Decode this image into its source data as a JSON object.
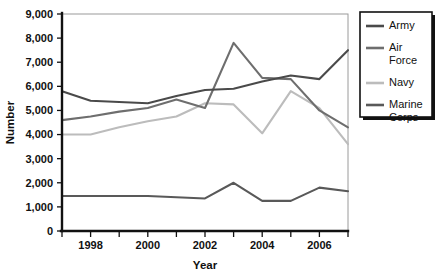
{
  "chart_data": {
    "type": "line",
    "title": "",
    "xlabel": "Year",
    "ylabel": "Number",
    "x": [
      1997,
      1998,
      1999,
      2000,
      2001,
      2002,
      2003,
      2004,
      2005,
      2006,
      2007
    ],
    "xtick_labels": [
      "1998",
      "2000",
      "2002",
      "2004",
      "2006"
    ],
    "xticks": [
      1998,
      2000,
      2002,
      2004,
      2006
    ],
    "xlim": [
      1997,
      2007
    ],
    "ylim": [
      0,
      9000
    ],
    "yticks": [
      0,
      1000,
      2000,
      3000,
      4000,
      5000,
      6000,
      7000,
      8000,
      9000
    ],
    "ytick_labels": [
      "0",
      "1,000",
      "2,000",
      "3,000",
      "4,000",
      "5,000",
      "6,000",
      "7,000",
      "8,000",
      "9,000"
    ],
    "grid": false,
    "legend_position": "right",
    "series": [
      {
        "name": "Army",
        "color": "#4a4a4a",
        "values": [
          5800,
          5400,
          5350,
          5300,
          5600,
          5850,
          5900,
          6200,
          6450,
          6300,
          7500
        ]
      },
      {
        "name": "Air Force",
        "color": "#6e6e6e",
        "values": [
          4600,
          4750,
          4950,
          5100,
          5450,
          5100,
          7800,
          6350,
          6300,
          5000,
          4300
        ]
      },
      {
        "name": "Navy",
        "color": "#bcbcbc",
        "values": [
          4000,
          4000,
          4300,
          4550,
          4750,
          5300,
          5250,
          4050,
          5800,
          5100,
          3600
        ]
      },
      {
        "name": "Marine Corps",
        "color": "#595959",
        "values": [
          1450,
          1450,
          1450,
          1450,
          1400,
          1350,
          2000,
          1250,
          1250,
          1800,
          1650
        ]
      }
    ],
    "legend_entries": [
      {
        "label_line1": "Army",
        "label_line2": "",
        "color": "#4a4a4a"
      },
      {
        "label_line1": "Air",
        "label_line2": "Force",
        "color": "#6e6e6e"
      },
      {
        "label_line1": "Navy",
        "label_line2": "",
        "color": "#bcbcbc"
      },
      {
        "label_line1": "Marine",
        "label_line2": "Corps",
        "color": "#595959"
      }
    ]
  }
}
